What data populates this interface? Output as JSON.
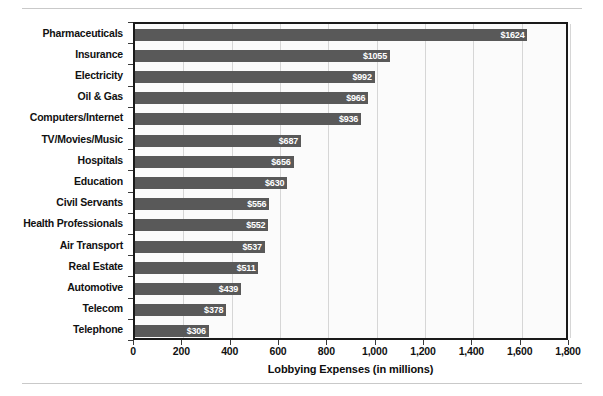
{
  "chart_data": {
    "type": "bar",
    "orientation": "horizontal",
    "title": "",
    "xlabel": "Lobbying Expenses (in millions)",
    "ylabel": "",
    "xlim": [
      0,
      1800
    ],
    "xticks": [
      0,
      200,
      400,
      600,
      800,
      1000,
      1200,
      1400,
      1600,
      1800
    ],
    "xtick_labels": [
      "0",
      "200",
      "400",
      "600",
      "800",
      "1,000",
      "1,200",
      "1,400",
      "1,600",
      "1,800"
    ],
    "grid": "vertical",
    "legend": "none",
    "categories": [
      "Pharmaceuticals",
      "Insurance",
      "Electricity",
      "Oil & Gas",
      "Computers/Internet",
      "TV/Movies/Music",
      "Hospitals",
      "Education",
      "Civil Servants",
      "Health Professionals",
      "Air Transport",
      "Real Estate",
      "Automotive",
      "Telecom",
      "Telephone"
    ],
    "values": [
      1624,
      1055,
      992,
      966,
      936,
      687,
      656,
      630,
      556,
      552,
      537,
      511,
      439,
      378,
      306
    ],
    "value_labels": [
      "$1624",
      "$1055",
      "$992",
      "$966",
      "$936",
      "$687",
      "$656",
      "$630",
      "$556",
      "$552",
      "$537",
      "$511",
      "$439",
      "$378",
      "$306"
    ],
    "bar_color": "#595959",
    "value_label_color": "#ffffff",
    "plot_background": "#fbfbfb",
    "gridline_color": "#d6d6d6",
    "axis_color": "#1a1a1a"
  }
}
